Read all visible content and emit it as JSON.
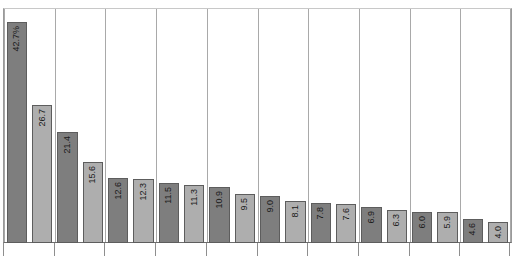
{
  "chart_data": {
    "type": "bar",
    "title": "",
    "subtitle": "",
    "xlabel": "",
    "ylabel": "",
    "grid": true,
    "legend": null,
    "orientation": "vertical",
    "ylim": [
      0,
      45
    ],
    "axis_visible": {
      "x": true,
      "y": false
    },
    "categories": [
      "1",
      "2",
      "3",
      "4",
      "5",
      "6",
      "7",
      "8",
      "9",
      "10",
      "11",
      "12",
      "13",
      "14",
      "15",
      "16",
      "17",
      "18",
      "19",
      "20"
    ],
    "values": [
      42.7,
      26.7,
      21.4,
      15.6,
      12.6,
      12.3,
      11.5,
      11.3,
      10.9,
      9.5,
      9.0,
      8.1,
      7.8,
      7.6,
      6.9,
      6.3,
      6.0,
      5.9,
      4.6,
      4.0
    ],
    "data_labels": [
      "42.7%",
      "26.7",
      "21.4",
      "15.6",
      "12.6",
      "12.3",
      "11.5",
      "11.3",
      "10.9",
      "9.5",
      "9.0",
      "8.1",
      "7.8",
      "7.6",
      "6.9",
      "6.3",
      "6.0",
      "5.9",
      "4.6",
      "4.0"
    ],
    "bar_colors": [
      "dark",
      "light",
      "dark",
      "light",
      "dark",
      "light",
      "dark",
      "light",
      "dark",
      "light",
      "dark",
      "light",
      "dark",
      "light",
      "dark",
      "light",
      "dark",
      "light",
      "dark",
      "light"
    ],
    "colors": {
      "bar_dark": "#7e7e7e",
      "bar_light": "#aeaeae",
      "bar_border": "#5d5d5d",
      "gridline": "#a9a9a9",
      "axis": "#6d6d6d",
      "label_text": "#1a1a1a",
      "background": "#ffffff"
    },
    "gridline_positions": [
      0,
      2,
      4,
      6,
      8,
      10,
      12,
      14,
      16,
      18,
      20
    ],
    "tick_positions": [
      0,
      2,
      4,
      6,
      8,
      10,
      12,
      14,
      16,
      18,
      20
    ]
  }
}
